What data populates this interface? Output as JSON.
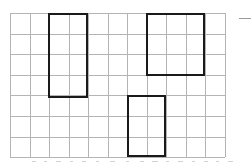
{
  "figure": {
    "background_color": "#ffffff"
  },
  "grid": {
    "name": "square-grid",
    "columns": 11,
    "rows": 7,
    "origin_x": 10,
    "origin_y": 13,
    "cell_width": 19.5,
    "cell_height": 20.6,
    "line_color": "#b4b4b4",
    "line_width": 1,
    "total_width": 214.5,
    "total_height": 144.2
  },
  "shapes": [
    {
      "name": "rectangle-left",
      "label": "Rectangle A",
      "col_start": 2,
      "row_start": 1,
      "cols": 2,
      "rows": 4,
      "x": 48,
      "y": 13,
      "width": 40,
      "height": 85,
      "stroke_color": "#1a1a1a",
      "stroke_width": 2,
      "fill": "none",
      "area_cells": 8
    },
    {
      "name": "rectangle-top-right",
      "label": "Rectangle B",
      "col_start": 7,
      "row_start": 1,
      "cols": 3,
      "rows": 3,
      "x": 146,
      "y": 13,
      "width": 59,
      "height": 63,
      "stroke_color": "#1a1a1a",
      "stroke_width": 2,
      "fill": "none",
      "area_cells": 9
    },
    {
      "name": "rectangle-bottom-middle",
      "label": "Rectangle C",
      "col_start": 6,
      "row_start": 5,
      "cols": 2,
      "rows": 3,
      "x": 127,
      "y": 95,
      "width": 39,
      "height": 62,
      "stroke_color": "#1a1a1a",
      "stroke_width": 2,
      "fill": "none",
      "area_cells": 6
    }
  ],
  "corner_mark": {
    "name": "crop-corner-mark",
    "x": 239,
    "y": 8,
    "vertical_length": 22,
    "horizontal_length": 12,
    "vertical_color": "#2b2b2b",
    "horizontal_color": "#9a9a9a"
  },
  "baseline_artifacts": {
    "name": "bottom-scan-artifacts",
    "y": 160,
    "marks": [
      {
        "x": 32,
        "w": 4
      },
      {
        "x": 44,
        "w": 3
      },
      {
        "x": 56,
        "w": 5
      },
      {
        "x": 70,
        "w": 3
      },
      {
        "x": 82,
        "w": 4
      },
      {
        "x": 96,
        "w": 3
      },
      {
        "x": 110,
        "w": 5
      },
      {
        "x": 126,
        "w": 3
      },
      {
        "x": 140,
        "w": 4
      },
      {
        "x": 152,
        "w": 6
      },
      {
        "x": 166,
        "w": 3
      },
      {
        "x": 178,
        "w": 5
      },
      {
        "x": 192,
        "w": 3
      },
      {
        "x": 204,
        "w": 4
      },
      {
        "x": 216,
        "w": 3
      },
      {
        "x": 228,
        "w": 5
      }
    ]
  }
}
